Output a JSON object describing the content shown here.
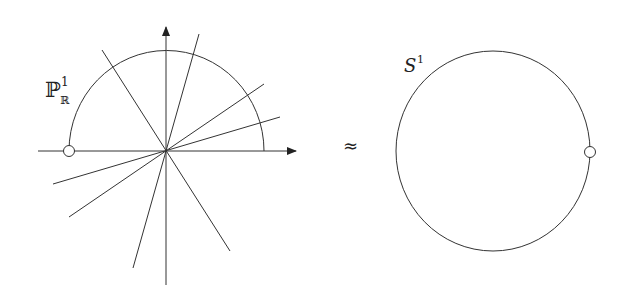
{
  "left_figure": {
    "label_main": "ℙ",
    "label_sup": "1",
    "label_sub": "ℝ",
    "description": "Lines through origin in R^2 with upper semicircle parameterizing them"
  },
  "relation_symbol": "≈",
  "right_figure": {
    "label_main": "S",
    "label_sup": "1",
    "description": "Circle with a marked point"
  },
  "colors": {
    "stroke": "#333333",
    "background": "#ffffff"
  }
}
